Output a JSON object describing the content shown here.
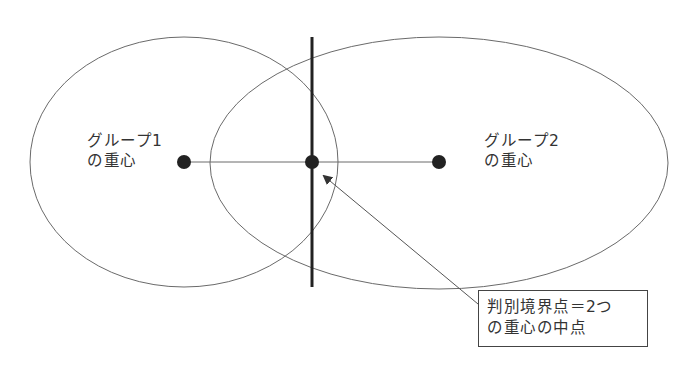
{
  "diagram": {
    "type": "discriminant-boundary-illustration",
    "colors": {
      "ellipse_stroke": "#6a6a6a",
      "boundary_line": "#222222",
      "centroid_dot": "#222222",
      "connector_line": "#6a6a6a",
      "arrow": "#555555",
      "text": "#333333",
      "box_border": "#444444"
    },
    "groups": [
      {
        "id": "group1",
        "label_line1": "グループ1",
        "label_line2": "の重心",
        "ellipse": {
          "cx": 184,
          "cy": 162,
          "rx": 154,
          "ry": 125
        },
        "centroid": {
          "x": 184,
          "y": 162
        }
      },
      {
        "id": "group2",
        "label_line1": "グループ2",
        "label_line2": "の重心",
        "ellipse": {
          "cx": 439,
          "cy": 163,
          "rx": 229,
          "ry": 126
        },
        "centroid": {
          "x": 439,
          "y": 162
        }
      }
    ],
    "boundary_point": {
      "x": 312,
      "y": 162
    },
    "boundary_line": {
      "x": 312,
      "y1": 37,
      "y2": 287
    },
    "callout": {
      "line1": "判別境界点＝2つ",
      "line2": "の重心の中点"
    }
  }
}
